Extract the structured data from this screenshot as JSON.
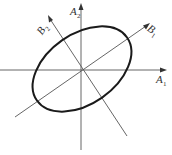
{
  "diagram": {
    "type": "rotated-axes-ellipse",
    "center": [
      81,
      70
    ],
    "axes": [
      {
        "id": "A1",
        "label": "A",
        "subscript": "1",
        "direction": "horizontal"
      },
      {
        "id": "A2",
        "label": "A",
        "subscript": "2",
        "direction": "vertical"
      },
      {
        "id": "B1",
        "label": "B",
        "subscript": "1",
        "direction": "rotated major axis (up-right)"
      },
      {
        "id": "B2",
        "label": "B",
        "subscript": "2",
        "direction": "rotated minor axis (up-left)"
      }
    ],
    "ellipse": {
      "aligned_with": "B1",
      "rotation_deg": -35
    },
    "colors": {
      "axes": "#555555",
      "ellipse": "#1a1a1a"
    }
  },
  "labels": {
    "a1": {
      "main": "A",
      "sub": "1"
    },
    "a2": {
      "main": "A",
      "sub": "2"
    },
    "b1": {
      "main": "B",
      "sub": "1"
    },
    "b2": {
      "main": "B",
      "sub": "2"
    }
  }
}
